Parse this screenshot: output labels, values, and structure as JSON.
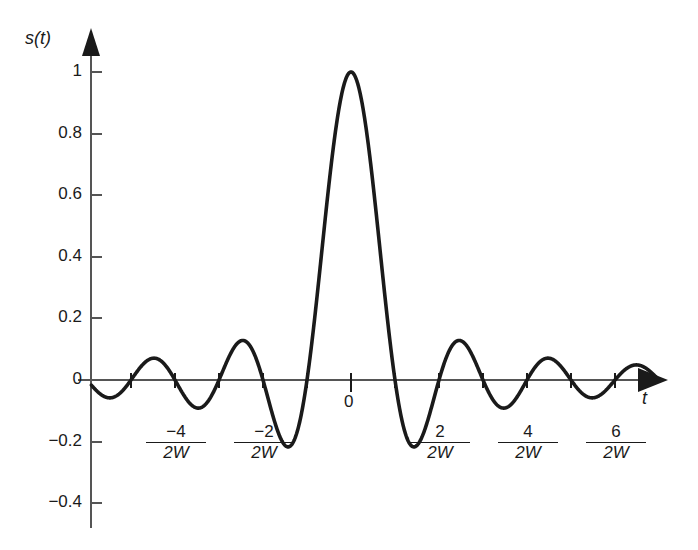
{
  "figure": {
    "y_axis_label": "s(t)",
    "x_axis_label": "t",
    "origin_label": "0"
  },
  "axes": {
    "y_ticks": [
      {
        "label": "1",
        "value": 1.0
      },
      {
        "label": "0.8",
        "value": 0.8
      },
      {
        "label": "0.6",
        "value": 0.6
      },
      {
        "label": "0.4",
        "value": 0.4
      },
      {
        "label": "0.2",
        "value": 0.2
      },
      {
        "label": "0",
        "value": 0.0
      },
      {
        "label": "−0.2",
        "value": -0.2
      },
      {
        "label": "−0.4",
        "value": -0.4
      }
    ],
    "x_ticks": [
      {
        "numerator": "−4",
        "denominator": "2W",
        "value": -4
      },
      {
        "numerator": "−2",
        "denominator": "2W",
        "value": -2
      },
      {
        "numerator": "0",
        "denominator": "",
        "value": 0
      },
      {
        "numerator": "2",
        "denominator": "2W",
        "value": 2
      },
      {
        "numerator": "4",
        "denominator": "2W",
        "value": 4
      },
      {
        "numerator": "6",
        "denominator": "2W",
        "value": 6
      }
    ],
    "x_tick_marks": [
      -5,
      -4,
      -3,
      -2,
      -1,
      0,
      1,
      2,
      3,
      4,
      5,
      6,
      7
    ]
  },
  "colors": {
    "curve": "#1a1a1a",
    "axis": "#555555",
    "background": "#ffffff"
  },
  "chart_data": {
    "type": "line",
    "title": "",
    "xlabel": "t",
    "ylabel": "s(t)",
    "function": "sinc",
    "formula": "s(t) = sin(2πWt) / (2πWt)",
    "xlim": [
      -5.9,
      7.0
    ],
    "ylim": [
      -0.45,
      1.08
    ],
    "x_unit": "1/(2W)",
    "grid": false,
    "legend": null,
    "x": [
      -5.9,
      -5.5,
      -5.0,
      -4.5,
      -4.0,
      -3.5,
      -3.0,
      -2.5,
      -2.0,
      -1.5,
      -1.0,
      -0.5,
      0.0,
      0.5,
      1.0,
      1.5,
      2.0,
      2.5,
      3.0,
      3.5,
      4.0,
      4.5,
      5.0,
      5.5,
      6.0,
      6.5,
      7.0
    ],
    "y": [
      0.0,
      -0.058,
      0.0,
      0.071,
      0.0,
      -0.091,
      0.0,
      0.127,
      0.0,
      -0.212,
      0.0,
      0.637,
      1.0,
      0.637,
      0.0,
      -0.212,
      0.0,
      0.127,
      0.0,
      -0.091,
      0.0,
      0.071,
      0.0,
      -0.058,
      0.0,
      0.049,
      0.0
    ],
    "zero_crossings": [
      -5,
      -4,
      -3,
      -2,
      -1,
      1,
      2,
      3,
      4,
      5,
      6,
      7
    ],
    "peak": {
      "x": 0,
      "y": 1.0
    },
    "side_lobe_extrema": [
      {
        "x": -1.43,
        "y": -0.217
      },
      {
        "x": 1.43,
        "y": -0.217
      },
      {
        "x": -2.46,
        "y": 0.128
      },
      {
        "x": 2.46,
        "y": 0.128
      },
      {
        "x": -3.47,
        "y": -0.091
      },
      {
        "x": 3.47,
        "y": -0.091
      },
      {
        "x": -4.48,
        "y": 0.071
      },
      {
        "x": 4.48,
        "y": 0.071
      },
      {
        "x": -5.48,
        "y": -0.058
      },
      {
        "x": 5.48,
        "y": -0.058
      },
      {
        "x": 6.48,
        "y": 0.049
      }
    ]
  }
}
